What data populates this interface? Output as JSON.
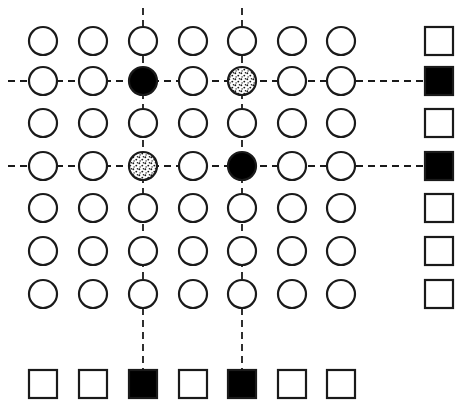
{
  "figure": {
    "title": "",
    "type": "lattice-diagram",
    "background_color": "#ffffff",
    "stroke_color": "#1a1a1a",
    "fill_color": "#000000",
    "width": 470,
    "height": 415
  },
  "layout": {
    "rows": 7,
    "cols": 7,
    "col_x": [
      43,
      93,
      143,
      193,
      242,
      292,
      341
    ],
    "row_y": [
      41,
      81,
      123,
      166,
      208,
      251,
      294
    ],
    "circle_radius": 14,
    "square_size": 28,
    "right_margin_x": 439,
    "bottom_margin_y": 384,
    "stroke_width": 2.2
  },
  "dash_lines": {
    "style": "dashed",
    "dash_pattern": "7 5",
    "stroke_width": 1.8,
    "color": "#1a1a1a",
    "horizontal_rows": [
      2,
      4
    ],
    "vertical_cols": [
      3,
      5
    ],
    "horizontal_extent": {
      "x_start": 8,
      "x_end": 439
    },
    "vertical_extent": {
      "y_start": 8,
      "y_end": 384
    }
  },
  "chart_data": {
    "type": "heatmap",
    "title": "",
    "xlabel": "",
    "ylabel": "",
    "categories": [
      "c1",
      "c2",
      "c3",
      "c4",
      "c5",
      "c6",
      "c7"
    ],
    "row_labels": [
      "r1",
      "r2",
      "r3",
      "r4",
      "r5",
      "r6",
      "r7"
    ],
    "legend": [],
    "states": {
      "open": "empty circle outline",
      "filled": "solid black circle",
      "stippled": "speckled/dotted fill circle"
    },
    "cells": [
      [
        "open",
        "open",
        "open",
        "open",
        "open",
        "open",
        "open"
      ],
      [
        "open",
        "open",
        "filled",
        "open",
        "stippled",
        "open",
        "open"
      ],
      [
        "open",
        "open",
        "open",
        "open",
        "open",
        "open",
        "open"
      ],
      [
        "open",
        "open",
        "stippled",
        "open",
        "filled",
        "open",
        "open"
      ],
      [
        "open",
        "open",
        "open",
        "open",
        "open",
        "open",
        "open"
      ],
      [
        "open",
        "open",
        "open",
        "open",
        "open",
        "open",
        "open"
      ],
      [
        "open",
        "open",
        "open",
        "open",
        "open",
        "open",
        "open"
      ]
    ],
    "right_column_squares": [
      "open",
      "filled",
      "open",
      "filled",
      "open",
      "open",
      "open"
    ],
    "bottom_row_squares": [
      "open",
      "open",
      "filled",
      "open",
      "filled",
      "open",
      "open"
    ]
  }
}
